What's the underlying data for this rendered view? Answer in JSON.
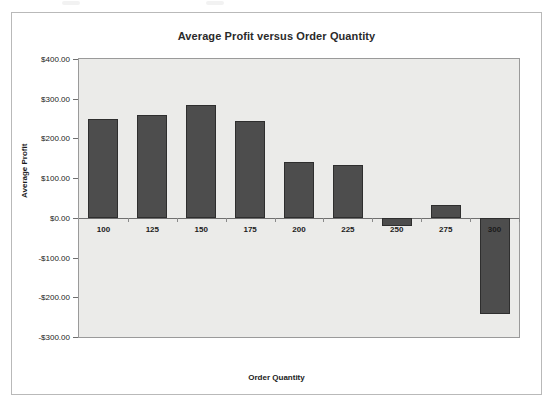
{
  "chart_data": {
    "type": "bar",
    "title": "Average Profit versus Order Quantity",
    "xlabel": "Order Quantity",
    "ylabel": "Average Profit",
    "categories": [
      "100",
      "125",
      "150",
      "175",
      "200",
      "225",
      "250",
      "275",
      "300"
    ],
    "values": [
      248,
      258,
      283,
      245,
      140,
      132,
      -20,
      33,
      -242
    ],
    "ylim": [
      -300,
      400
    ],
    "ytick_step": 100,
    "ytick_labels": [
      "$400.00",
      "$300.00",
      "$200.00",
      "$100.00",
      "$0.00",
      "-$100.00",
      "-$200.00",
      "-$300.00"
    ],
    "ytick_values": [
      400,
      300,
      200,
      100,
      0,
      -100,
      -200,
      -300
    ],
    "grid": false,
    "legend": "none",
    "series_name": "Average Profit",
    "colors": {
      "bar_fill": "#4d4d4d",
      "bar_border": "#2e2e2e",
      "plot_background": "#ebebe9",
      "card_background": "#ffffff",
      "card_border": "#b9b9b9",
      "axis_line": "#6f6f6f",
      "text": "#1b1b1b"
    }
  }
}
